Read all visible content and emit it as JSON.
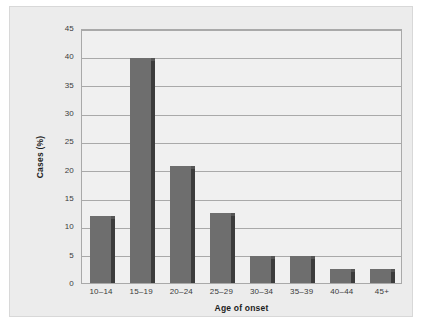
{
  "chart_data": {
    "type": "bar",
    "title": "",
    "xlabel": "Age of onset",
    "ylabel": "Cases (%)",
    "categories": [
      "10–14",
      "15–19",
      "20–24",
      "25–29",
      "30–34",
      "35–39",
      "40–44",
      "45+"
    ],
    "values": [
      11.9,
      39.7,
      20.6,
      12.4,
      4.7,
      4.7,
      2.4,
      2.4
    ],
    "ylim": [
      0,
      45
    ],
    "ytick_labels": [
      "0",
      "5",
      "10",
      "15",
      "20",
      "25",
      "30",
      "35",
      "40",
      "45"
    ],
    "ytick_values": [
      0,
      5,
      10,
      15,
      20,
      25,
      30,
      35,
      40,
      45
    ],
    "grid": true,
    "legend": "none",
    "colors": {
      "bar_fill": "#6e6e6e",
      "bar_shade": "#3c3c3c",
      "plot_background": "#f0f0f0",
      "panel_background": "#ececec",
      "gridline": "#a9a9a9",
      "axis_text": "#3b3b3b",
      "axis_title_text": "#1d1d1d"
    }
  }
}
